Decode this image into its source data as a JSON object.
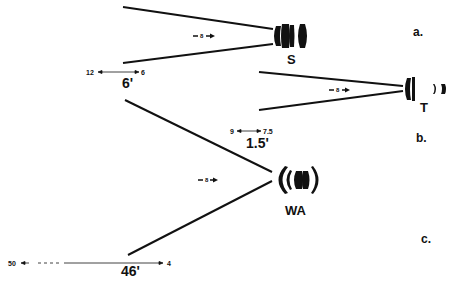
{
  "panels": [
    {
      "id": "a",
      "letter": "a.",
      "lens_name": "S",
      "lens_type": "standard",
      "distance": "6'",
      "range_far": "12",
      "range_near": "6",
      "aperture_marker": "8"
    },
    {
      "id": "b",
      "letter": "b.",
      "lens_name": "T",
      "lens_type": "telephoto",
      "distance": "1.5'",
      "range_far": "9",
      "range_near": "7.5",
      "aperture_marker": "8"
    },
    {
      "id": "c",
      "letter": "c.",
      "lens_name": "WA",
      "lens_type": "wide-angle",
      "distance": "46'",
      "range_far": "50",
      "range_near": "4",
      "aperture_marker": "8"
    }
  ],
  "colors": {
    "ink": "#111111",
    "background": "#ffffff"
  }
}
